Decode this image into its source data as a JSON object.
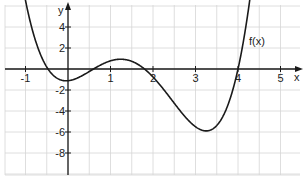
{
  "chart_data": {
    "type": "line",
    "title": "",
    "xlabel": "x",
    "ylabel": "y",
    "xlim": [
      -1.5,
      5.45
    ],
    "ylim": [
      -10,
      6.3
    ],
    "grid": true,
    "x_ticks": [
      -1,
      1,
      2,
      3,
      4,
      5
    ],
    "x_tick_labels": [
      "-1",
      "1",
      "2",
      "3",
      "4",
      "5"
    ],
    "y_ticks": [
      4,
      2,
      -2,
      -4,
      -6,
      -8
    ],
    "y_tick_labels": [
      "4",
      "2",
      "-2",
      "-4",
      "-6",
      "-8"
    ],
    "series": [
      {
        "name": "f(x)",
        "label": "f(x)",
        "formula": "0.55*(x+0.47)*(x-0.6)*(x-1.8)*(x-4)",
        "x": [
          -1.0,
          -0.5,
          0.0,
          0.6,
          1.2,
          1.8,
          2.5,
          3.3,
          4.0,
          4.3
        ],
        "y": [
          5.9,
          0.1,
          -1.1,
          0.0,
          0.6,
          0.0,
          -3.5,
          -6.0,
          0.0,
          6.0
        ]
      }
    ],
    "annotations": [
      {
        "text": "f(x)",
        "x": 4.2,
        "y": 2.3
      }
    ],
    "legend": "none"
  },
  "labels": {
    "x_axis": "x",
    "y_axis": "y",
    "curve_label": "f(x)"
  }
}
